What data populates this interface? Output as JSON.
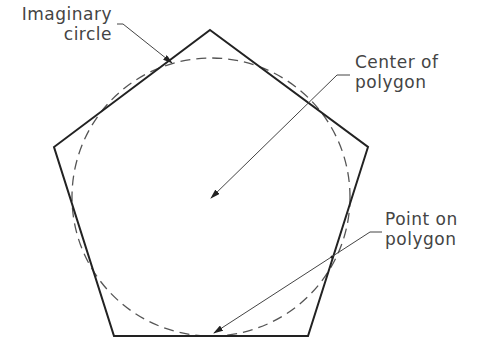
{
  "diagram": {
    "colors": {
      "stroke": "#222222",
      "dashed": "#555555",
      "leader": "#444444",
      "text": "#444444"
    },
    "polygon": {
      "type": "pentagon",
      "points": [
        [
          210,
          30
        ],
        [
          368,
          147
        ],
        [
          308,
          336
        ],
        [
          114,
          336
        ],
        [
          54,
          147
        ]
      ]
    },
    "circle": {
      "cx": 211,
      "cy": 197,
      "r": 139,
      "style": "dashed"
    },
    "labels": [
      {
        "id": "imaginary-circle",
        "lines": [
          "Imaginary",
          "circle"
        ]
      },
      {
        "id": "center-of-polygon",
        "lines": [
          "Center of",
          "polygon"
        ]
      },
      {
        "id": "point-on-polygon",
        "lines": [
          "Point on",
          "polygon"
        ]
      }
    ]
  }
}
